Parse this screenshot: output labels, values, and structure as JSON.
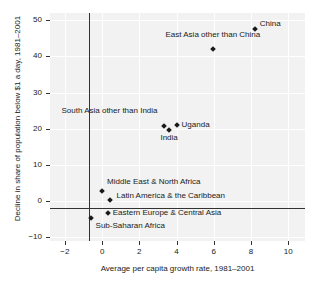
{
  "chart_data": {
    "type": "scatter",
    "title": "",
    "xlabel": "Average per capita growth rate, 1981–2001",
    "ylabel": "Decline in share of population below $1 a day, 1981–2001",
    "xlim": [
      -2.8,
      10.9
    ],
    "ylim": [
      -11.0,
      52.0
    ],
    "xticks": [
      "−2",
      "0",
      "2",
      "4",
      "6",
      "8",
      "10"
    ],
    "xtick_values": [
      -2,
      0,
      2,
      4,
      6,
      8,
      10
    ],
    "yticks": [
      "50",
      "40",
      "30",
      "20",
      "10",
      "0",
      "−10"
    ],
    "ytick_values": [
      50,
      40,
      30,
      20,
      10,
      0,
      -10
    ],
    "grid": true,
    "grid_color": "#ffffff",
    "plot_background": "#f2f2f2",
    "marker_color": "#1a1a1a",
    "axis_color": "#333333",
    "legend": "none",
    "points": [
      {
        "name": "China",
        "x": 8.2,
        "y": 47.5,
        "label": "China",
        "label_pos": "right"
      },
      {
        "name": "East Asia other than China",
        "x": 5.95,
        "y": 42.0,
        "label": "East Asia other than China",
        "label_pos": "above"
      },
      {
        "name": "South Asia other than India",
        "x": 3.3,
        "y": 20.9,
        "label": "South Asia other than India",
        "label_pos": "upper-left"
      },
      {
        "name": "India",
        "x": 3.6,
        "y": 19.8,
        "label": "India",
        "label_pos": "below"
      },
      {
        "name": "Uganda",
        "x": 4.0,
        "y": 21.0,
        "label": "Uganda",
        "label_pos": "right"
      },
      {
        "name": "Middle East & North Africa",
        "x": 0.0,
        "y": 2.8,
        "label": "Middle East & North Africa",
        "label_pos": "above-right"
      },
      {
        "name": "Latin America & the Caribbean",
        "x": 0.45,
        "y": 0.2,
        "label": "Latin America & the Caribbean",
        "label_pos": "above-right"
      },
      {
        "name": "Eastern Europe & Central Asia",
        "x": 0.3,
        "y": -3.2,
        "label": "Eastern Europe & Central Asia",
        "label_pos": "right"
      },
      {
        "name": "Sub-Saharan Africa",
        "x": -0.62,
        "y": -4.6,
        "label": "Sub-Saharan Africa",
        "label_pos": "below-right"
      }
    ]
  }
}
